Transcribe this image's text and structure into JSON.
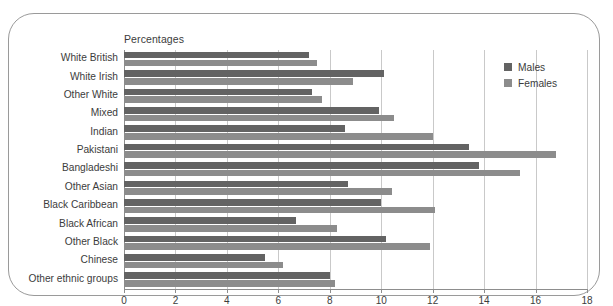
{
  "frame": {
    "border_color": "#9a9a9a"
  },
  "chart_data": {
    "type": "bar",
    "orientation": "horizontal",
    "title": "",
    "axis_note": "Percentages",
    "xlabel": "",
    "ylabel": "",
    "xlim": [
      0,
      18
    ],
    "xticks": [
      0,
      2,
      4,
      6,
      8,
      10,
      12,
      14,
      16,
      18
    ],
    "grid": true,
    "legend_position": "top-right",
    "categories": [
      "White British",
      "White Irish",
      "Other White",
      "Mixed",
      "Indian",
      "Pakistani",
      "Bangladeshi",
      "Other Asian",
      "Black Caribbean",
      "Black African",
      "Other Black",
      "Chinese",
      "Other ethnic groups"
    ],
    "series": [
      {
        "name": "Males",
        "color": "#636363",
        "values": [
          7.2,
          10.1,
          7.3,
          9.9,
          8.6,
          13.4,
          13.8,
          8.7,
          10.0,
          6.7,
          10.2,
          5.5,
          8.0
        ]
      },
      {
        "name": "Females",
        "color": "#8c8c8c",
        "values": [
          7.5,
          8.9,
          7.7,
          10.5,
          12.0,
          16.8,
          15.4,
          10.4,
          12.1,
          8.3,
          11.9,
          6.2,
          8.2
        ]
      }
    ]
  }
}
